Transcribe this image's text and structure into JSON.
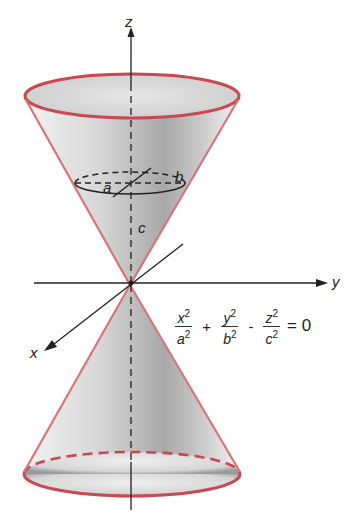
{
  "diagram": {
    "axes": {
      "z_label": "z",
      "y_label": "y",
      "x_label": "x"
    },
    "cross_section_labels": {
      "a": "a",
      "b": "b",
      "c": "c"
    },
    "equation": {
      "terms": [
        {
          "num": "x",
          "num_exp": "2",
          "den": "a",
          "den_exp": "2"
        },
        {
          "op": "+"
        },
        {
          "num": "y",
          "num_exp": "2",
          "den": "b",
          "den_exp": "2"
        },
        {
          "op": "-"
        },
        {
          "num": "z",
          "num_exp": "2",
          "den": "c",
          "den_exp": "2"
        }
      ],
      "rhs": "= 0",
      "plus": "+",
      "minus": "-"
    },
    "colors": {
      "cone_edge": "#c8494f",
      "cone_fill": "#bdbdbd",
      "axis": "#222222"
    }
  }
}
